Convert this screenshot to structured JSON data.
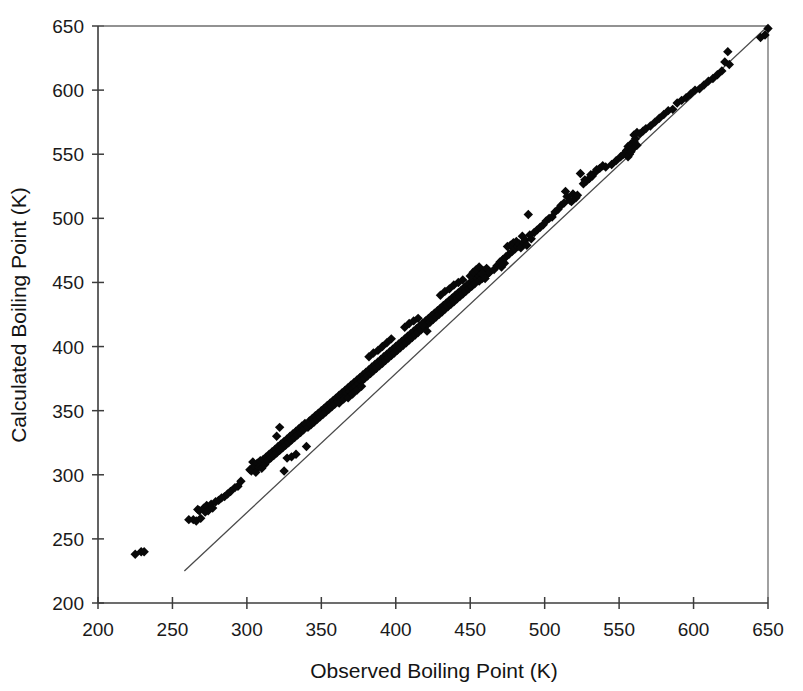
{
  "figure": {
    "background": "#ffffff",
    "marker_color": "#080808",
    "line_color": "#4a4a4a",
    "axis_color": "#3c3c3c"
  },
  "chart_data": {
    "type": "scatter",
    "title": "",
    "xlabel": "Observed Boiling Point (K)",
    "ylabel": "Calculated Boiling Point (K)",
    "xlim": [
      200,
      650
    ],
    "ylim": [
      200,
      650
    ],
    "xticks": [
      200,
      250,
      300,
      350,
      400,
      450,
      500,
      550,
      600,
      650
    ],
    "yticks": [
      200,
      250,
      300,
      350,
      400,
      450,
      500,
      550,
      600,
      650
    ],
    "xticklabels": [
      "200",
      "250",
      "300",
      "350",
      "400",
      "450",
      "500",
      "550",
      "600",
      "650"
    ],
    "yticklabels": [
      "200",
      "250",
      "300",
      "350",
      "400",
      "450",
      "500",
      "550",
      "600",
      "650"
    ],
    "grid": false,
    "legend": null,
    "marker": "diamond",
    "marker_size": 7,
    "series": [
      {
        "name": "Compounds",
        "points": [
          [
            225,
            238
          ],
          [
            229,
            240
          ],
          [
            231,
            240
          ],
          [
            261,
            265
          ],
          [
            264,
            265
          ],
          [
            266,
            264
          ],
          [
            267,
            273
          ],
          [
            268,
            272
          ],
          [
            269,
            266
          ],
          [
            271,
            274
          ],
          [
            272,
            271
          ],
          [
            273,
            276
          ],
          [
            274,
            272
          ],
          [
            276,
            277
          ],
          [
            277,
            274
          ],
          [
            279,
            279
          ],
          [
            281,
            280
          ],
          [
            283,
            282
          ],
          [
            285,
            283
          ],
          [
            287,
            285
          ],
          [
            289,
            287
          ],
          [
            292,
            290
          ],
          [
            294,
            291
          ],
          [
            296,
            295
          ],
          [
            302,
            304
          ],
          [
            303,
            303
          ],
          [
            304,
            310
          ],
          [
            305,
            307
          ],
          [
            306,
            302
          ],
          [
            307,
            309
          ],
          [
            308,
            306
          ],
          [
            309,
            311
          ],
          [
            310,
            305
          ],
          [
            311,
            312
          ],
          [
            312,
            308
          ],
          [
            313,
            314
          ],
          [
            314,
            311
          ],
          [
            315,
            316
          ],
          [
            316,
            313
          ],
          [
            317,
            318
          ],
          [
            318,
            315
          ],
          [
            319,
            320
          ],
          [
            320,
            317
          ],
          [
            321,
            322
          ],
          [
            322,
            319
          ],
          [
            323,
            324
          ],
          [
            324,
            321
          ],
          [
            325,
            326
          ],
          [
            326,
            323
          ],
          [
            327,
            328
          ],
          [
            328,
            325
          ],
          [
            329,
            330
          ],
          [
            330,
            327
          ],
          [
            331,
            332
          ],
          [
            332,
            329
          ],
          [
            333,
            334
          ],
          [
            334,
            331
          ],
          [
            335,
            336
          ],
          [
            336,
            333
          ],
          [
            337,
            338
          ],
          [
            338,
            335
          ],
          [
            339,
            340
          ],
          [
            340,
            322
          ],
          [
            341,
            337
          ],
          [
            342,
            342
          ],
          [
            343,
            339
          ],
          [
            344,
            344
          ],
          [
            345,
            341
          ],
          [
            346,
            346
          ],
          [
            347,
            343
          ],
          [
            348,
            348
          ],
          [
            349,
            345
          ],
          [
            325,
            303
          ],
          [
            327,
            313
          ],
          [
            330,
            314
          ],
          [
            333,
            316
          ],
          [
            320,
            330
          ],
          [
            322,
            337
          ],
          [
            350,
            350
          ],
          [
            351,
            347
          ],
          [
            352,
            352
          ],
          [
            353,
            349
          ],
          [
            354,
            354
          ],
          [
            355,
            351
          ],
          [
            356,
            356
          ],
          [
            357,
            353
          ],
          [
            358,
            358
          ],
          [
            359,
            355
          ],
          [
            360,
            360
          ],
          [
            361,
            357
          ],
          [
            362,
            362
          ],
          [
            363,
            359
          ],
          [
            364,
            364
          ],
          [
            365,
            361
          ],
          [
            366,
            366
          ],
          [
            367,
            363
          ],
          [
            368,
            368
          ],
          [
            369,
            365
          ],
          [
            370,
            370
          ],
          [
            371,
            367
          ],
          [
            372,
            372
          ],
          [
            373,
            369
          ],
          [
            374,
            374
          ],
          [
            375,
            371
          ],
          [
            376,
            376
          ],
          [
            377,
            373
          ],
          [
            378,
            378
          ],
          [
            379,
            375
          ],
          [
            362,
            356
          ],
          [
            365,
            359
          ],
          [
            368,
            360
          ],
          [
            371,
            363
          ],
          [
            374,
            366
          ],
          [
            377,
            369
          ],
          [
            380,
            380
          ],
          [
            381,
            377
          ],
          [
            382,
            382
          ],
          [
            383,
            379
          ],
          [
            384,
            384
          ],
          [
            385,
            381
          ],
          [
            386,
            386
          ],
          [
            387,
            383
          ],
          [
            388,
            388
          ],
          [
            389,
            385
          ],
          [
            390,
            390
          ],
          [
            391,
            387
          ],
          [
            392,
            392
          ],
          [
            393,
            389
          ],
          [
            394,
            394
          ],
          [
            395,
            391
          ],
          [
            396,
            396
          ],
          [
            397,
            393
          ],
          [
            398,
            398
          ],
          [
            399,
            395
          ],
          [
            400,
            400
          ],
          [
            401,
            397
          ],
          [
            402,
            402
          ],
          [
            403,
            399
          ],
          [
            382,
            392
          ],
          [
            385,
            395
          ],
          [
            388,
            397
          ],
          [
            391,
            400
          ],
          [
            394,
            403
          ],
          [
            397,
            406
          ],
          [
            404,
            404
          ],
          [
            405,
            401
          ],
          [
            406,
            406
          ],
          [
            407,
            403
          ],
          [
            408,
            408
          ],
          [
            409,
            405
          ],
          [
            410,
            410
          ],
          [
            411,
            407
          ],
          [
            412,
            412
          ],
          [
            413,
            409
          ],
          [
            414,
            414
          ],
          [
            415,
            411
          ],
          [
            416,
            416
          ],
          [
            417,
            413
          ],
          [
            418,
            418
          ],
          [
            419,
            415
          ],
          [
            420,
            420
          ],
          [
            421,
            417
          ],
          [
            422,
            422
          ],
          [
            423,
            419
          ],
          [
            424,
            424
          ],
          [
            425,
            421
          ],
          [
            426,
            426
          ],
          [
            427,
            423
          ],
          [
            406,
            415
          ],
          [
            409,
            418
          ],
          [
            412,
            420
          ],
          [
            415,
            422
          ],
          [
            418,
            417
          ],
          [
            421,
            412
          ],
          [
            428,
            428
          ],
          [
            429,
            425
          ],
          [
            430,
            430
          ],
          [
            431,
            427
          ],
          [
            432,
            432
          ],
          [
            433,
            429
          ],
          [
            434,
            434
          ],
          [
            435,
            431
          ],
          [
            436,
            436
          ],
          [
            437,
            433
          ],
          [
            438,
            438
          ],
          [
            439,
            435
          ],
          [
            440,
            440
          ],
          [
            441,
            437
          ],
          [
            442,
            442
          ],
          [
            443,
            439
          ],
          [
            444,
            444
          ],
          [
            445,
            441
          ],
          [
            446,
            446
          ],
          [
            447,
            443
          ],
          [
            448,
            448
          ],
          [
            449,
            445
          ],
          [
            450,
            450
          ],
          [
            451,
            447
          ],
          [
            430,
            440
          ],
          [
            433,
            443
          ],
          [
            436,
            445
          ],
          [
            439,
            448
          ],
          [
            442,
            450
          ],
          [
            445,
            452
          ],
          [
            452,
            452
          ],
          [
            453,
            449
          ],
          [
            454,
            454
          ],
          [
            455,
            456
          ],
          [
            456,
            451
          ],
          [
            457,
            457
          ],
          [
            458,
            453
          ],
          [
            459,
            459
          ],
          [
            460,
            455
          ],
          [
            461,
            461
          ],
          [
            462,
            457
          ],
          [
            463,
            458
          ],
          [
            450,
            455
          ],
          [
            452,
            458
          ],
          [
            454,
            460
          ],
          [
            456,
            462
          ],
          [
            458,
            457
          ],
          [
            460,
            453
          ],
          [
            466,
            460
          ],
          [
            468,
            463
          ],
          [
            470,
            466
          ],
          [
            472,
            468
          ],
          [
            474,
            470
          ],
          [
            476,
            472
          ],
          [
            471,
            462
          ],
          [
            473,
            465
          ],
          [
            475,
            478
          ],
          [
            477,
            479
          ],
          [
            478,
            474
          ],
          [
            479,
            481
          ],
          [
            480,
            476
          ],
          [
            481,
            482
          ],
          [
            482,
            478
          ],
          [
            483,
            480
          ],
          [
            484,
            477
          ],
          [
            485,
            486
          ],
          [
            486,
            481
          ],
          [
            487,
            483
          ],
          [
            488,
            479
          ],
          [
            489,
            503
          ],
          [
            490,
            487
          ],
          [
            491,
            484
          ],
          [
            493,
            489
          ],
          [
            495,
            491
          ],
          [
            497,
            493
          ],
          [
            499,
            495
          ],
          [
            501,
            498
          ],
          [
            503,
            500
          ],
          [
            505,
            501
          ],
          [
            507,
            505
          ],
          [
            509,
            507
          ],
          [
            511,
            510
          ],
          [
            513,
            512
          ],
          [
            515,
            517
          ],
          [
            517,
            514
          ],
          [
            519,
            519
          ],
          [
            521,
            516
          ],
          [
            514,
            521
          ],
          [
            518,
            513
          ],
          [
            522,
            518
          ],
          [
            524,
            535
          ],
          [
            526,
            527
          ],
          [
            528,
            529
          ],
          [
            530,
            531
          ],
          [
            532,
            533
          ],
          [
            534,
            536
          ],
          [
            527,
            530
          ],
          [
            531,
            534
          ],
          [
            535,
            538
          ],
          [
            537,
            539
          ],
          [
            539,
            541
          ],
          [
            541,
            540
          ],
          [
            545,
            542
          ],
          [
            548,
            545
          ],
          [
            551,
            548
          ],
          [
            553,
            550
          ],
          [
            555,
            553
          ],
          [
            556,
            556
          ],
          [
            557,
            550
          ],
          [
            558,
            558
          ],
          [
            559,
            554
          ],
          [
            560,
            560
          ],
          [
            561,
            562
          ],
          [
            562,
            557
          ],
          [
            556,
            548
          ],
          [
            558,
            552
          ],
          [
            560,
            565
          ],
          [
            562,
            567
          ],
          [
            564,
            566
          ],
          [
            566,
            568
          ],
          [
            568,
            570
          ],
          [
            571,
            572
          ],
          [
            574,
            575
          ],
          [
            577,
            578
          ],
          [
            580,
            581
          ],
          [
            583,
            584
          ],
          [
            586,
            585
          ],
          [
            589,
            590
          ],
          [
            592,
            592
          ],
          [
            595,
            594
          ],
          [
            598,
            597
          ],
          [
            601,
            600
          ],
          [
            604,
            601
          ],
          [
            607,
            604
          ],
          [
            610,
            607
          ],
          [
            613,
            609
          ],
          [
            616,
            612
          ],
          [
            619,
            615
          ],
          [
            621,
            622
          ],
          [
            623,
            630
          ],
          [
            624,
            620
          ],
          [
            648,
            643
          ],
          [
            645,
            641
          ],
          [
            650,
            648
          ]
        ]
      }
    ],
    "fit_line": {
      "name": "regression-line",
      "x_start": 258,
      "y_start": 225,
      "x_end": 650,
      "y_end": 650
    }
  }
}
